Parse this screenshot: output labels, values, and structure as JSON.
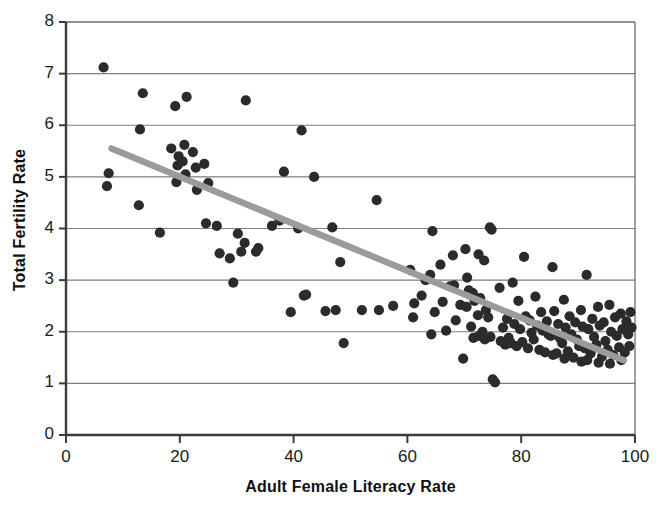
{
  "chart_data": {
    "type": "scatter",
    "title": "",
    "xlabel": "Adult Female Literacy Rate",
    "ylabel": "Total Fertility Rate",
    "xlim": [
      0,
      100
    ],
    "ylim": [
      0,
      8
    ],
    "xticks": [
      0,
      20,
      40,
      60,
      80,
      100
    ],
    "yticks": [
      0,
      1,
      2,
      3,
      4,
      5,
      6,
      7,
      8
    ],
    "grid": "horizontal",
    "legend": "none",
    "marker_color": "#2b2b2b",
    "trendline_color": "#9b9b9b",
    "trendline": {
      "x_start": 8.0,
      "y_start": 5.55,
      "x_end": 98.0,
      "y_end": 1.45
    },
    "points": [
      [
        6.6,
        7.12
      ],
      [
        7.5,
        5.07
      ],
      [
        7.2,
        4.82
      ],
      [
        13.5,
        6.62
      ],
      [
        13.0,
        5.92
      ],
      [
        12.8,
        4.45
      ],
      [
        16.5,
        3.92
      ],
      [
        18.5,
        5.55
      ],
      [
        19.2,
        6.37
      ],
      [
        19.6,
        5.22
      ],
      [
        19.8,
        5.4
      ],
      [
        19.4,
        4.9
      ],
      [
        20.5,
        5.3
      ],
      [
        20.8,
        5.62
      ],
      [
        21.2,
        6.55
      ],
      [
        21.0,
        5.05
      ],
      [
        22.3,
        5.48
      ],
      [
        22.8,
        5.18
      ],
      [
        23.0,
        4.75
      ],
      [
        24.3,
        5.25
      ],
      [
        25.0,
        4.88
      ],
      [
        24.6,
        4.1
      ],
      [
        26.5,
        4.05
      ],
      [
        27.0,
        3.52
      ],
      [
        28.8,
        3.42
      ],
      [
        29.4,
        2.95
      ],
      [
        30.2,
        3.9
      ],
      [
        30.8,
        3.55
      ],
      [
        31.6,
        6.48
      ],
      [
        31.4,
        3.72
      ],
      [
        33.4,
        3.55
      ],
      [
        33.8,
        3.62
      ],
      [
        36.2,
        4.05
      ],
      [
        37.5,
        4.15
      ],
      [
        38.3,
        5.1
      ],
      [
        39.5,
        2.38
      ],
      [
        40.8,
        4.0
      ],
      [
        41.4,
        5.9
      ],
      [
        41.8,
        2.7
      ],
      [
        42.2,
        2.72
      ],
      [
        43.6,
        5.0
      ],
      [
        45.6,
        2.4
      ],
      [
        46.8,
        4.02
      ],
      [
        47.4,
        2.42
      ],
      [
        48.2,
        3.35
      ],
      [
        48.8,
        1.78
      ],
      [
        52.0,
        2.42
      ],
      [
        54.6,
        4.55
      ],
      [
        55.0,
        2.42
      ],
      [
        57.5,
        2.5
      ],
      [
        60.5,
        3.2
      ],
      [
        61.2,
        2.55
      ],
      [
        61.0,
        2.28
      ],
      [
        62.5,
        2.7
      ],
      [
        63.2,
        3.0
      ],
      [
        64.4,
        3.95
      ],
      [
        64.0,
        3.1
      ],
      [
        64.8,
        2.38
      ],
      [
        64.2,
        1.95
      ],
      [
        65.8,
        3.3
      ],
      [
        66.2,
        2.58
      ],
      [
        66.8,
        2.02
      ],
      [
        67.5,
        2.88
      ],
      [
        68.0,
        3.48
      ],
      [
        68.2,
        2.9
      ],
      [
        68.5,
        2.22
      ],
      [
        69.3,
        2.52
      ],
      [
        69.8,
        1.48
      ],
      [
        70.2,
        3.6
      ],
      [
        70.5,
        3.05
      ],
      [
        70.8,
        2.8
      ],
      [
        70.4,
        2.48
      ],
      [
        71.5,
        2.75
      ],
      [
        71.8,
        2.6
      ],
      [
        71.2,
        2.1
      ],
      [
        71.6,
        1.88
      ],
      [
        72.5,
        3.5
      ],
      [
        72.8,
        2.65
      ],
      [
        72.4,
        2.32
      ],
      [
        72.6,
        1.92
      ],
      [
        73.5,
        3.38
      ],
      [
        73.8,
        2.42
      ],
      [
        73.2,
        2.0
      ],
      [
        73.6,
        1.85
      ],
      [
        74.5,
        4.02
      ],
      [
        74.8,
        3.98
      ],
      [
        74.2,
        2.28
      ],
      [
        74.6,
        1.9
      ],
      [
        75.0,
        1.08
      ],
      [
        75.4,
        1.02
      ],
      [
        76.2,
        2.85
      ],
      [
        76.8,
        2.08
      ],
      [
        76.4,
        1.82
      ],
      [
        77.5,
        2.25
      ],
      [
        77.8,
        1.88
      ],
      [
        77.2,
        1.75
      ],
      [
        78.5,
        2.95
      ],
      [
        78.8,
        2.15
      ],
      [
        78.2,
        1.78
      ],
      [
        79.5,
        2.6
      ],
      [
        79.8,
        2.05
      ],
      [
        79.2,
        1.72
      ],
      [
        80.5,
        3.45
      ],
      [
        80.8,
        2.3
      ],
      [
        80.2,
        1.8
      ],
      [
        81.5,
        2.22
      ],
      [
        81.8,
        1.98
      ],
      [
        81.2,
        1.68
      ],
      [
        82.5,
        2.68
      ],
      [
        82.8,
        2.12
      ],
      [
        82.2,
        1.85
      ],
      [
        83.5,
        2.38
      ],
      [
        83.8,
        2.02
      ],
      [
        83.2,
        1.65
      ],
      [
        84.5,
        2.2
      ],
      [
        84.8,
        1.95
      ],
      [
        84.2,
        1.6
      ],
      [
        85.5,
        3.25
      ],
      [
        85.8,
        2.4
      ],
      [
        85.2,
        1.92
      ],
      [
        85.6,
        1.55
      ],
      [
        86.5,
        2.15
      ],
      [
        86.8,
        1.88
      ],
      [
        86.2,
        1.58
      ],
      [
        87.5,
        2.62
      ],
      [
        87.8,
        2.08
      ],
      [
        87.2,
        1.78
      ],
      [
        87.6,
        1.48
      ],
      [
        88.5,
        2.3
      ],
      [
        88.8,
        1.95
      ],
      [
        88.2,
        1.62
      ],
      [
        89.5,
        2.18
      ],
      [
        89.8,
        1.85
      ],
      [
        89.2,
        1.5
      ],
      [
        90.5,
        2.42
      ],
      [
        90.8,
        2.1
      ],
      [
        90.2,
        1.72
      ],
      [
        90.6,
        1.42
      ],
      [
        91.5,
        3.1
      ],
      [
        91.8,
        2.05
      ],
      [
        91.2,
        1.68
      ],
      [
        91.6,
        1.45
      ],
      [
        92.5,
        2.25
      ],
      [
        92.8,
        1.9
      ],
      [
        92.2,
        1.58
      ],
      [
        93.5,
        2.48
      ],
      [
        93.8,
        2.12
      ],
      [
        93.2,
        1.75
      ],
      [
        93.6,
        1.4
      ],
      [
        94.5,
        2.18
      ],
      [
        94.8,
        1.82
      ],
      [
        94.2,
        1.52
      ],
      [
        95.5,
        2.52
      ],
      [
        95.8,
        2.0
      ],
      [
        95.2,
        1.65
      ],
      [
        95.6,
        1.38
      ],
      [
        96.5,
        2.28
      ],
      [
        96.8,
        1.92
      ],
      [
        96.2,
        1.55
      ],
      [
        97.5,
        2.35
      ],
      [
        97.8,
        2.05
      ],
      [
        97.2,
        1.7
      ],
      [
        97.6,
        1.45
      ],
      [
        98.5,
        2.2
      ],
      [
        98.8,
        1.95
      ],
      [
        98.2,
        1.6
      ],
      [
        99.2,
        2.38
      ],
      [
        99.4,
        2.08
      ],
      [
        99.0,
        1.72
      ]
    ]
  },
  "axes": {
    "x_tick_labels": [
      "0",
      "20",
      "40",
      "60",
      "80",
      "100"
    ],
    "y_tick_labels": [
      "0",
      "1",
      "2",
      "3",
      "4",
      "5",
      "6",
      "7",
      "8"
    ],
    "x_title": "Adult Female Literacy Rate",
    "y_title": "Total Fertility Rate"
  }
}
